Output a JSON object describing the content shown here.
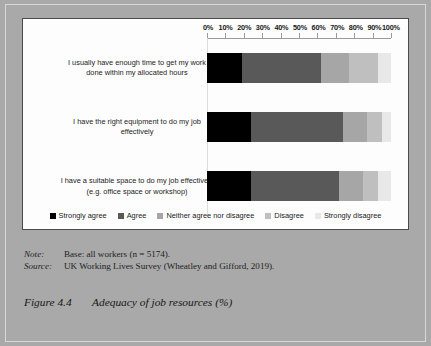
{
  "chart_data": {
    "type": "bar",
    "orientation": "horizontal",
    "stacked": true,
    "stacked_mode": "percent",
    "title": "Adequacy of job resources (%)",
    "xlabel": "",
    "ylabel": "",
    "xlim": [
      0,
      100
    ],
    "grid": false,
    "legend_position": "bottom",
    "axis_ticks": [
      "0%",
      "10%",
      "20%",
      "30%",
      "40%",
      "50%",
      "60%",
      "70%",
      "80%",
      "90%",
      "100%"
    ],
    "axis_tick_values": [
      0,
      10,
      20,
      30,
      40,
      50,
      60,
      70,
      80,
      90,
      100
    ],
    "categories": [
      "I usually have enough time to get my work done within my allocated hours",
      "I have the right equipment to do my job effectively",
      "I have a suitable space to do my job effectively (e.g. office space or workshop)"
    ],
    "category_lines": [
      [
        "I usually have enough time to get my work",
        "done within my allocated hours"
      ],
      [
        "I have the right equipment to do my job",
        "effectively"
      ],
      [
        "I have a suitable space to do my job effectively",
        "(e.g. office space or workshop)"
      ]
    ],
    "series": [
      {
        "name": "Strongly agree",
        "color": "#000000",
        "values": [
          19,
          24,
          24
        ]
      },
      {
        "name": "Agree",
        "color": "#595959",
        "values": [
          43,
          50,
          48
        ]
      },
      {
        "name": "Neither agree nor disagree",
        "color": "#a6a6a6",
        "values": [
          15,
          13,
          13
        ]
      },
      {
        "name": "Disagree",
        "color": "#bfbfbf",
        "values": [
          16,
          8,
          8
        ]
      },
      {
        "name": "Strongly disagree",
        "color": "#e8e8e8",
        "values": [
          7,
          5,
          7
        ]
      }
    ]
  },
  "notes": {
    "note_label": "Note:",
    "note_text": "Base: all workers (n = 5174).",
    "source_label": "Source:",
    "source_text": "UK Working Lives Survey (Wheatley and Gifford, 2019)."
  },
  "caption": {
    "number": "Figure 4.4",
    "title": "Adequacy of job resources (%)"
  },
  "colors": {
    "page_background": "#a9a9a9",
    "panel_background": "#fdfdfd",
    "panel_border": "#4a4a4a",
    "axis": "#9a9a9a",
    "text": "#1a1a1a"
  }
}
